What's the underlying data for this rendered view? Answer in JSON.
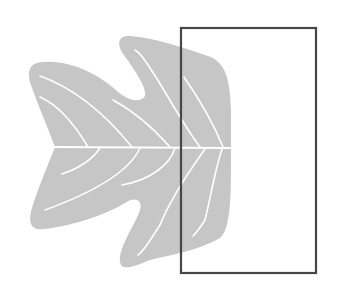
{
  "figure": {
    "colors": {
      "background": "#ffffff",
      "leaf": "#c6c6c6",
      "veins": "#ffffff",
      "rectangle_stroke": "#474747"
    },
    "rectangle": {
      "x": 181,
      "y": 28,
      "width": 135,
      "height": 245
    },
    "leaf": {
      "midrib": {
        "x1": 55,
        "y1": 147,
        "x2": 231,
        "y2": 148
      }
    }
  }
}
